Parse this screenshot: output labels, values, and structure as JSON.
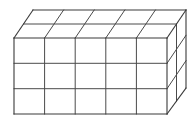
{
  "figure": {
    "name": "rectangular-prism-unit-cube-block",
    "background_color": "#ffffff",
    "line_color": "#3a3a3a",
    "grid_line_color": "#4a4a4a",
    "line_width": 1,
    "dimensions": {
      "width_cubes": 5,
      "height_cubes": 3,
      "depth_cubes": 2,
      "total_cubes": 30
    },
    "geometry": {
      "front_top_left": [
        14,
        38
      ],
      "front_top_right": [
        167,
        38
      ],
      "front_bottom_left": [
        14,
        114
      ],
      "front_bottom_right": [
        167,
        114
      ],
      "depth_offset_x": 19,
      "depth_offset_y": -28,
      "cell_width": 30.6,
      "cell_height": 25.33
    },
    "faces": {
      "front": {
        "columns": 5,
        "rows": 3,
        "visible": true
      },
      "top": {
        "columns": 5,
        "rows": 2,
        "visible": true
      },
      "right": {
        "columns": 2,
        "rows": 3,
        "visible": true
      }
    }
  },
  "canvas": {
    "width": 195,
    "height": 121
  }
}
